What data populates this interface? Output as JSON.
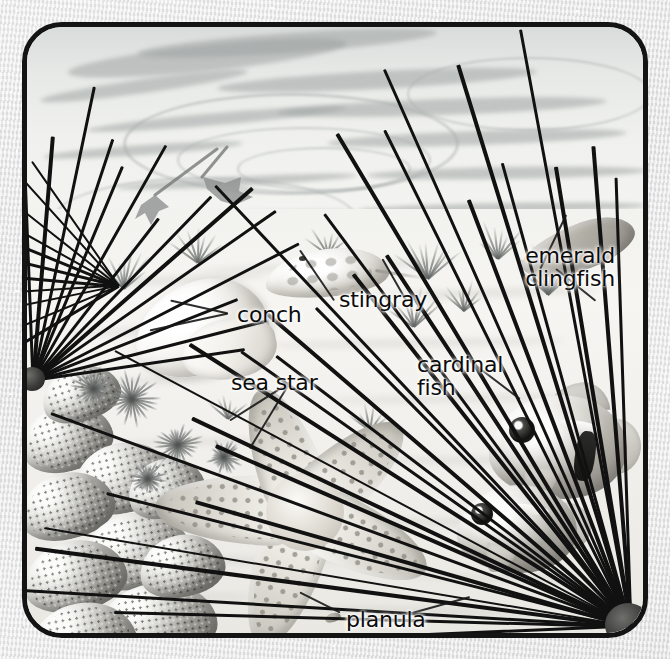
{
  "illustration": {
    "title": "Coral reef cross-section illustration",
    "frame": {
      "border_color": "#141414",
      "corner_radius": "40px",
      "background": "#f2f2f0"
    },
    "page_background": "#e9e9e9",
    "palette": {
      "ink": "#0b0b0b",
      "spine": "#111111",
      "sand": "#f2f0ec",
      "water": "#e7e9e7",
      "coral": "#a9a8a2"
    },
    "labels": [
      {
        "id": "conch",
        "text": "conch",
        "x": 232,
        "y": 303,
        "align": "left"
      },
      {
        "id": "stingray",
        "text": "stingray",
        "x": 334,
        "y": 288,
        "align": "left"
      },
      {
        "id": "sea-star",
        "text": "sea star",
        "x": 226,
        "y": 371,
        "align": "left"
      },
      {
        "id": "cardinal-fish",
        "text": "cardinal\nfish",
        "x": 412,
        "y": 353,
        "align": "left"
      },
      {
        "id": "emerald-clingfish",
        "text": "emerald\nclingfish",
        "x": 620,
        "y": 244,
        "align": "right"
      },
      {
        "id": "planula",
        "text": "planula",
        "x": 341,
        "y": 608,
        "align": "left"
      }
    ],
    "subjects": [
      {
        "id": "conch",
        "common_name": "conch"
      },
      {
        "id": "stingray",
        "common_name": "stingray"
      },
      {
        "id": "sea-star",
        "common_name": "sea star"
      },
      {
        "id": "cardinal-fish",
        "common_name": "cardinal fish"
      },
      {
        "id": "emerald-clingfish",
        "common_name": "emerald clingfish"
      },
      {
        "id": "planula",
        "common_name": "planula"
      }
    ]
  }
}
